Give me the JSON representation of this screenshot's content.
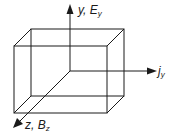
{
  "diagram": {
    "type": "3d-box-with-axes",
    "stroke_color": "#1a1a1a",
    "box": {
      "front": {
        "x1": 14,
        "y1": 46,
        "x2": 107,
        "y2": 113
      },
      "back": {
        "x1": 31,
        "y1": 29,
        "x2": 124,
        "y2": 96
      }
    },
    "origin": {
      "x": 70,
      "y": 71
    },
    "axes": [
      {
        "name": "y",
        "label_main": "y, ",
        "label_var": "E",
        "label_sub": "y",
        "direction": "up",
        "tip": {
          "x": 70,
          "y": 5
        }
      },
      {
        "name": "x",
        "label_main": "",
        "label_var": "j",
        "label_sub": "y",
        "direction": "right",
        "tip": {
          "x": 156,
          "y": 71
        }
      },
      {
        "name": "z",
        "label_main": "z, ",
        "label_var": "B",
        "label_sub": "z",
        "direction": "down-left",
        "tip": {
          "x": 14,
          "y": 127
        }
      }
    ]
  }
}
